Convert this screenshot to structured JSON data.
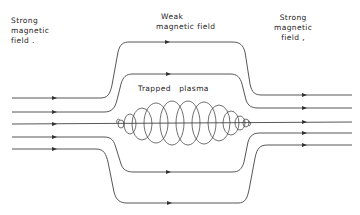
{
  "labels": {
    "left": [
      "Strong",
      "magnetic",
      "field ."
    ],
    "center_top": [
      "Weak",
      "magnetic field"
    ],
    "right": [
      "Strong",
      "magnetic",
      "field ,"
    ],
    "plasma": "Trapped   plasma"
  },
  "diagram": {
    "type": "magnetic mirror",
    "field_lines": [
      {
        "name": "outer-top",
        "left_y": 98,
        "mid_y": 42,
        "right_y": 95
      },
      {
        "name": "inner-top",
        "left_y": 112,
        "mid_y": 74,
        "right_y": 108
      },
      {
        "name": "axis",
        "left_y": 124,
        "mid_y": 124,
        "right_y": 122
      },
      {
        "name": "inner-bottom",
        "left_y": 137,
        "mid_y": 172,
        "right_y": 133
      },
      {
        "name": "outer-bottom",
        "left_y": 149,
        "mid_y": 203,
        "right_y": 145
      }
    ],
    "arrow_direction": "right",
    "colors": {
      "line": "#444444",
      "text": "#222222",
      "background": "#ffffff"
    }
  }
}
